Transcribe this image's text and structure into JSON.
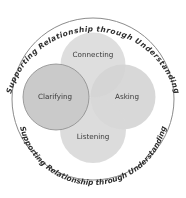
{
  "diagram": {
    "title_arc_top": "Supporting Relationship through Understanding",
    "title_arc_bottom": "Supporting Relationship through Understanding",
    "nodes": [
      {
        "id": "connecting",
        "label": "Connecting"
      },
      {
        "id": "clarifying",
        "label": "Clarifying"
      },
      {
        "id": "asking",
        "label": "Asking"
      },
      {
        "id": "listening",
        "label": "Listening"
      }
    ],
    "colors": {
      "background": "#ffffff",
      "outer_ring": "#8c8c8c",
      "petal_fill": "#d6d6d6",
      "clarifying_fill": "#cacaca",
      "clarifying_border": "#8a8a8a",
      "text": "#333333"
    }
  }
}
